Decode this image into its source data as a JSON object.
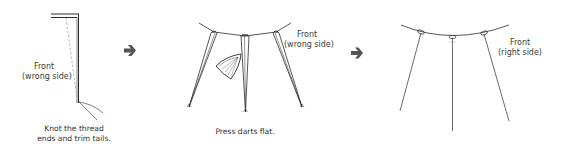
{
  "colors": {
    "line": "#2b2b2b",
    "dashed": "#9a9a9a",
    "arrow": "#555555",
    "text": "#3a3a3a",
    "background": "#ffffff"
  },
  "steps": [
    {
      "label_line1": "Front",
      "label_line2": "(wrong side)",
      "caption_line1": "Knot the thread",
      "caption_line2": "ends and trim tails."
    },
    {
      "label_line1": "Front",
      "label_line2": "(wrong side)",
      "caption_line1": "Press darts flat.",
      "tool": "iron-icon"
    },
    {
      "label_line1": "Front",
      "label_line2": "(right side)"
    }
  ],
  "arrows": [
    {
      "icon": "arrow-right-icon"
    },
    {
      "icon": "arrow-right-icon"
    }
  ]
}
